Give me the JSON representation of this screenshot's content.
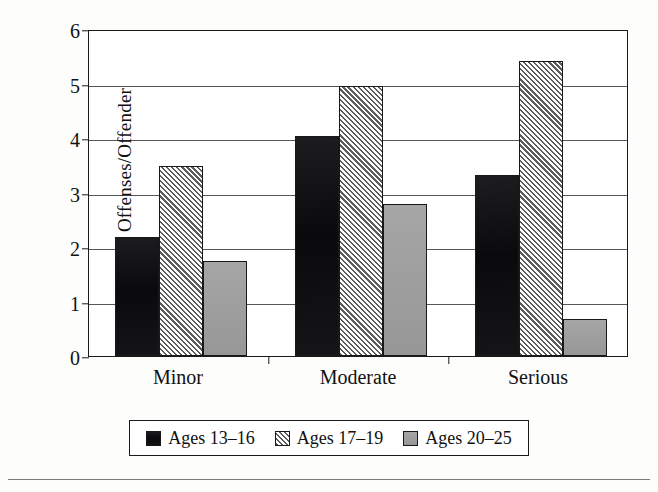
{
  "chart_data": {
    "type": "bar",
    "title": "",
    "xlabel": "",
    "ylabel": "Offenses/Offender",
    "categories": [
      "Minor",
      "Moderate",
      "Serious"
    ],
    "series": [
      {
        "name": "Ages 13–16",
        "values": [
          2.18,
          4.03,
          3.32
        ],
        "color": "#141416",
        "pattern": "solid"
      },
      {
        "name": "Ages 17–19",
        "values": [
          3.49,
          4.95,
          5.41
        ],
        "color": "#5d5d5d",
        "pattern": "hatch"
      },
      {
        "name": "Ages 20–25",
        "values": [
          1.74,
          2.79,
          0.68
        ],
        "color": "#9c9c9c",
        "pattern": "gray"
      }
    ],
    "ylim": [
      0,
      6
    ],
    "yticks": [
      0,
      1,
      2,
      3,
      4,
      5,
      6
    ],
    "ytick_labels": [
      "0",
      "1",
      "2",
      "3",
      "4",
      "5",
      "6"
    ],
    "grid": true,
    "grid_axis": "y",
    "legend_position": "bottom",
    "bar_border_color": "#18181a",
    "axis_color": "#1a1a1a",
    "gridline_color": "#55555a",
    "background_color": "#ffffff"
  }
}
